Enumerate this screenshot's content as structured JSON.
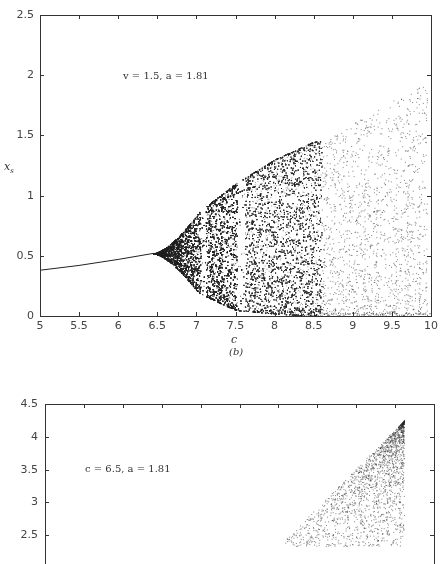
{
  "chart_data": [
    {
      "type": "scatter",
      "panel": "(b)",
      "title": "",
      "annotation": "v = 1.5, a = 1.81",
      "xlabel": "c",
      "ylabel": "x_s",
      "xlim": [
        5,
        10
      ],
      "ylim": [
        0,
        2.5
      ],
      "xticks": [
        "5",
        "5.5",
        "6",
        "6.5",
        "7",
        "7.5",
        "8",
        "8.5",
        "9",
        "9.5",
        "10"
      ],
      "yticks": [
        "0",
        "0.5",
        "1",
        "1.5",
        "2",
        "2.5"
      ],
      "grid": false,
      "description": "Bifurcation diagram: single stable branch rising from x≈0.38 at c=5 to x≈0.52 at c≈6.45, then chaotic band expanding (upper envelope ≈1.1 at c=7.5, ≈1.45 at c=8.5), with periodic windows near c≈7.1 and 7.6; sparse points beyond c=8.6 up to x≈1.95 at c≈9.9",
      "stable_branch": {
        "x": [
          5,
          5.5,
          6,
          6.45
        ],
        "y": [
          0.38,
          0.42,
          0.47,
          0.52
        ]
      },
      "chaotic_envelope": {
        "c": [
          6.45,
          7.0,
          7.5,
          8.0,
          8.5
        ],
        "upper": [
          0.52,
          0.85,
          1.1,
          1.3,
          1.45
        ],
        "lower": [
          0.52,
          0.2,
          0.05,
          0.02,
          0.0
        ]
      },
      "sparse_region": {
        "c_range": [
          8.6,
          10
        ],
        "y_max_at_c": [
          [
            9.0,
            1.6
          ],
          [
            9.5,
            1.85
          ],
          [
            9.9,
            1.95
          ]
        ]
      }
    },
    {
      "type": "scatter",
      "panel": "(c)",
      "annotation": "c = 6.5, a = 1.81",
      "ylim": [
        2.5,
        4.5
      ],
      "yticks": [
        "2.5",
        "3",
        "3.5",
        "4",
        "4.5"
      ],
      "xticks_visible": false,
      "grid": false,
      "description": "Triangular scatter region bounded by vertical right edge near the 10th tick, apex at y≈4.25, diagonal lower-left boundary (cropped at bottom of image)"
    }
  ],
  "top_plot": {
    "annotation": "v = 1.5, a = 1.81",
    "ylabel": "x",
    "ylabel_sub": "s",
    "xlabel": "c",
    "panel_label": "(b)",
    "yticks": [
      {
        "label": "2.5",
        "value": 2.5
      },
      {
        "label": "2",
        "value": 2
      },
      {
        "label": "1.5",
        "value": 1.5
      },
      {
        "label": "1",
        "value": 1
      },
      {
        "label": "0.5",
        "value": 0.5
      },
      {
        "label": "0",
        "value": 0
      }
    ],
    "xticks": [
      {
        "label": "5",
        "value": 5
      },
      {
        "label": "5.5",
        "value": 5.5
      },
      {
        "label": "6",
        "value": 6
      },
      {
        "label": "6.5",
        "value": 6.5
      },
      {
        "label": "7",
        "value": 7
      },
      {
        "label": "7.5",
        "value": 7.5
      },
      {
        "label": "8",
        "value": 8
      },
      {
        "label": "8.5",
        "value": 8.5
      },
      {
        "label": "9",
        "value": 9
      },
      {
        "label": "9.5",
        "value": 9.5
      },
      {
        "label": "10",
        "value": 10
      }
    ]
  },
  "bottom_plot": {
    "annotation": "c = 6.5, a = 1.81",
    "yticks": [
      {
        "label": "4.5",
        "value": 4.5
      },
      {
        "label": "4",
        "value": 4
      },
      {
        "label": "3.5",
        "value": 3.5
      },
      {
        "label": "3",
        "value": 3
      },
      {
        "label": "2.5",
        "value": 2.5
      }
    ]
  },
  "colors": {
    "ink": "#222222",
    "axis": "#333333",
    "background": "#ffffff"
  }
}
